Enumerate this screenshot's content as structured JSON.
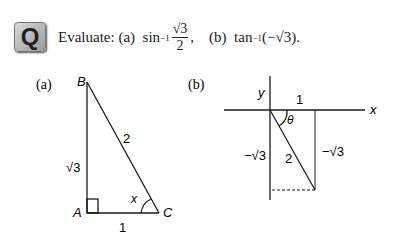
{
  "question": {
    "icon": "Q",
    "prefix": "Evaluate:",
    "part_a_label": "(a)",
    "part_a_func": "sin",
    "part_a_sup": "−1",
    "part_a_num": "√3",
    "part_a_den": "2",
    "sep": ",",
    "part_b_label": "(b)",
    "part_b_func": "tan",
    "part_b_sup": "−1",
    "part_b_arg": "(−√3)."
  },
  "figure_a": {
    "label": "(a)",
    "vertices": {
      "A": "A",
      "B": "B",
      "C": "C"
    },
    "angle": "x",
    "sides": {
      "AB": "√3",
      "BC": "2",
      "AC": "1"
    }
  },
  "figure_b": {
    "label": "(b)",
    "axes": {
      "x": "x",
      "y": "y"
    },
    "angle": "θ",
    "sides": {
      "top": "1",
      "hyp": "2",
      "left": "−√3",
      "right": "−√3"
    }
  }
}
